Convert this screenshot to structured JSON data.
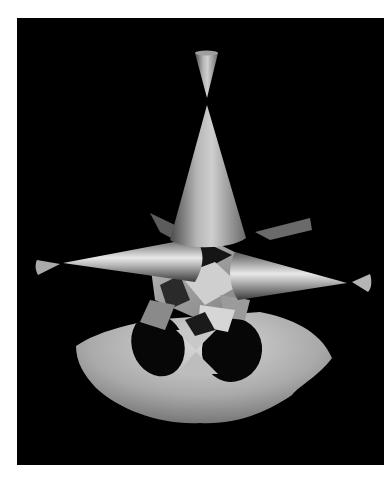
{
  "image": {
    "subject": "rendered algebraic surface",
    "description": "Grey shaded 3D surface on black background: a double cone at top, a large vertical cone, horizontal spike cones to left and right, and a flared skirt at the bottom with two dark elliptical openings",
    "background_color": "#000000",
    "page_color": "#ffffff",
    "surface_color": "#9a9a9a",
    "highlight_color": "#e6e6e6"
  }
}
